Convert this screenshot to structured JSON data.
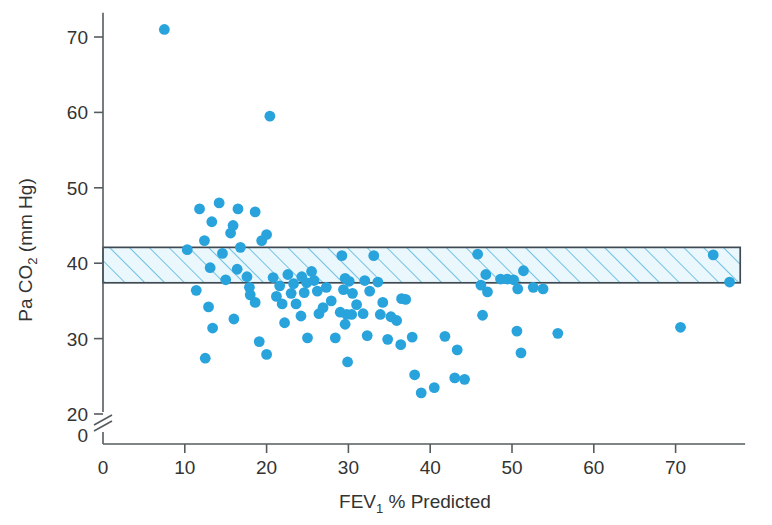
{
  "chart_data": {
    "type": "scatter",
    "title": "",
    "xlabel": "FEV₁ % Predicted",
    "xlabel_parts": {
      "main": "FEV",
      "sub": "1",
      "rest": "% Predicted"
    },
    "ylabel": "Pa CO₂ (mm Hg)",
    "ylabel_parts": {
      "main": "Pa CO",
      "sub": "2",
      "rest": "(mm Hg)"
    },
    "xlim": [
      0,
      78
    ],
    "ylim": [
      20,
      72
    ],
    "y_axis_break": true,
    "y_break_label": "0",
    "xticks": [
      0,
      10,
      20,
      30,
      40,
      50,
      60,
      70
    ],
    "yticks": [
      20,
      30,
      40,
      50,
      60,
      70
    ],
    "grid": false,
    "legend": null,
    "point_color": "#29a3dc",
    "point_radius": 5.4,
    "reference_band": {
      "label": "normal range band",
      "y_low": 37.4,
      "y_high": 42.1,
      "x_start": 0,
      "x_end": 77.9,
      "fill": "#eaf7fc",
      "hatch_color": "#5bb8e0",
      "border": "#3f4a52"
    },
    "points": [
      [
        7.5,
        71.0
      ],
      [
        20.4,
        59.5
      ],
      [
        11.8,
        47.2
      ],
      [
        14.2,
        48.0
      ],
      [
        13.3,
        45.5
      ],
      [
        12.4,
        43.0
      ],
      [
        16.5,
        47.2
      ],
      [
        15.9,
        45.0
      ],
      [
        15.6,
        44.0
      ],
      [
        18.6,
        46.8
      ],
      [
        20.0,
        43.8
      ],
      [
        12.9,
        34.2
      ],
      [
        11.4,
        36.4
      ],
      [
        13.4,
        31.4
      ],
      [
        12.5,
        27.4
      ],
      [
        10.3,
        41.8
      ],
      [
        14.6,
        41.3
      ],
      [
        13.1,
        39.4
      ],
      [
        16.8,
        42.1
      ],
      [
        16.4,
        39.2
      ],
      [
        17.6,
        38.2
      ],
      [
        17.9,
        36.8
      ],
      [
        18.0,
        35.8
      ],
      [
        18.6,
        34.8
      ],
      [
        16.0,
        32.6
      ],
      [
        19.1,
        29.6
      ],
      [
        20.0,
        27.9
      ],
      [
        20.8,
        38.1
      ],
      [
        21.6,
        37.0
      ],
      [
        21.2,
        35.6
      ],
      [
        21.9,
        34.6
      ],
      [
        22.6,
        38.5
      ],
      [
        23.3,
        37.3
      ],
      [
        23.0,
        36.0
      ],
      [
        23.6,
        34.6
      ],
      [
        24.3,
        38.2
      ],
      [
        24.9,
        37.4
      ],
      [
        24.6,
        36.1
      ],
      [
        25.5,
        38.9
      ],
      [
        25.8,
        37.7
      ],
      [
        26.2,
        36.3
      ],
      [
        22.2,
        32.1
      ],
      [
        24.2,
        33.0
      ],
      [
        26.4,
        33.3
      ],
      [
        29.2,
        41.0
      ],
      [
        29.6,
        38.0
      ],
      [
        29.4,
        36.5
      ],
      [
        30.1,
        37.6
      ],
      [
        30.5,
        36.0
      ],
      [
        29.0,
        33.5
      ],
      [
        29.8,
        33.2
      ],
      [
        30.4,
        33.2
      ],
      [
        29.6,
        31.9
      ],
      [
        31.0,
        34.5
      ],
      [
        31.8,
        33.3
      ],
      [
        32.0,
        37.7
      ],
      [
        32.6,
        36.3
      ],
      [
        33.1,
        41.0
      ],
      [
        33.6,
        37.5
      ],
      [
        34.2,
        34.8
      ],
      [
        33.9,
        33.2
      ],
      [
        28.4,
        30.1
      ],
      [
        29.9,
        26.9
      ],
      [
        32.3,
        30.4
      ],
      [
        35.2,
        32.9
      ],
      [
        35.9,
        32.4
      ],
      [
        36.5,
        35.3
      ],
      [
        37.0,
        35.2
      ],
      [
        37.8,
        30.2
      ],
      [
        38.1,
        25.2
      ],
      [
        38.9,
        22.8
      ],
      [
        40.5,
        23.5
      ],
      [
        36.4,
        29.2
      ],
      [
        41.8,
        30.3
      ],
      [
        43.3,
        28.5
      ],
      [
        44.2,
        24.6
      ],
      [
        43.0,
        24.8
      ],
      [
        45.8,
        41.2
      ],
      [
        46.8,
        38.5
      ],
      [
        46.2,
        37.1
      ],
      [
        47.0,
        36.2
      ],
      [
        46.4,
        33.1
      ],
      [
        48.6,
        37.9
      ],
      [
        49.4,
        37.9
      ],
      [
        50.2,
        37.8
      ],
      [
        50.7,
        36.6
      ],
      [
        51.4,
        39.0
      ],
      [
        50.6,
        31.0
      ],
      [
        51.1,
        28.1
      ],
      [
        52.6,
        36.8
      ],
      [
        53.8,
        36.6
      ],
      [
        55.6,
        30.7
      ],
      [
        70.6,
        31.5
      ],
      [
        74.6,
        41.1
      ],
      [
        76.6,
        37.5
      ],
      [
        27.3,
        36.8
      ],
      [
        27.9,
        35.0
      ],
      [
        26.9,
        34.1
      ],
      [
        19.4,
        43.0
      ],
      [
        15.0,
        37.8
      ],
      [
        25.0,
        30.1
      ],
      [
        34.8,
        29.9
      ]
    ]
  }
}
